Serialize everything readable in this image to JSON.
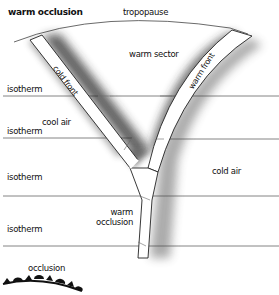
{
  "title": "warm occlusion",
  "labels": {
    "tropopause": "tropopause",
    "warm_sector": "warm sector",
    "cold_front": "cold front",
    "warm_front": "warm front",
    "cool_air": "cool air",
    "cold_air": "cold air",
    "warm_occlusion_line1": "warm",
    "warm_occlusion_line2": "occlusion",
    "isotherm_1": "isotherm",
    "isotherm_2": "isotherm",
    "isotherm_3": "isotherm",
    "isotherm_4": "isotherm",
    "legend_occlusion": "occlusion"
  },
  "colors": {
    "line": "#555555",
    "front_fill": "#ffffff",
    "front_edge": "#222222",
    "shadow": "#4a4a4a",
    "symbol": "#111111"
  }
}
